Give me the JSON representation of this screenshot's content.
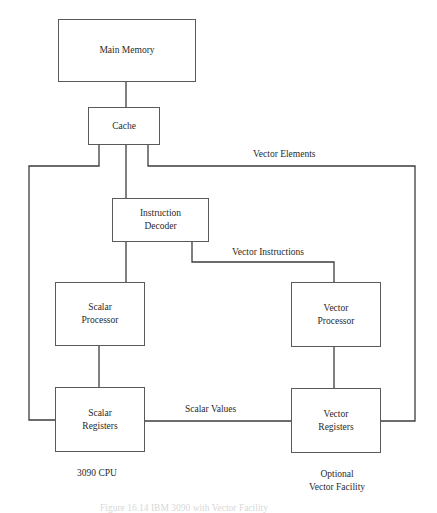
{
  "diagram": {
    "nodes": {
      "main_memory": {
        "label": "Main Memory"
      },
      "cache": {
        "label": "Cache"
      },
      "instruction_decoder": {
        "line1": "Instruction",
        "line2": "Decoder"
      },
      "scalar_processor": {
        "line1": "Scalar",
        "line2": "Processor"
      },
      "vector_processor": {
        "line1": "Vector",
        "line2": "Processor"
      },
      "scalar_registers": {
        "line1": "Scalar",
        "line2": "Registers"
      },
      "vector_registers": {
        "line1": "Vector",
        "line2": "Registers"
      }
    },
    "edge_labels": {
      "vector_elements": "Vector Elements",
      "vector_instructions": "Vector Instructions",
      "scalar_values": "Scalar Values"
    },
    "group_labels": {
      "cpu": "3090 CPU",
      "vector_facility_line1": "Optional",
      "vector_facility_line2": "Vector Facility"
    },
    "caption": "Figure 16.14  IBM 3090 with Vector Facility"
  }
}
